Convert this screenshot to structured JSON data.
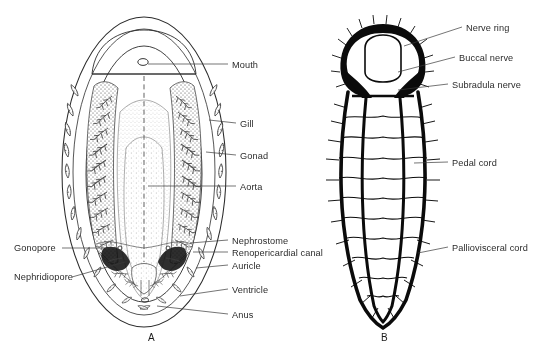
{
  "figure": {
    "domain": "scientific-illustration",
    "background_color": "#ffffff",
    "ink_color": "#0b0b0b",
    "label_color": "#2b2b2b",
    "panels": [
      {
        "letter": "A",
        "caption": "A",
        "description": "Ventral view showing mantle cavity, gills and internal organs",
        "letter_pos": {
          "x": 148,
          "y": 332
        }
      },
      {
        "letter": "B",
        "caption": "B",
        "description": "Nervous system: nerve ring with paired pedal and palliovisceral cords",
        "letter_pos": {
          "x": 381,
          "y": 332
        }
      }
    ],
    "labels_panel_a": [
      {
        "text": "Mouth",
        "side": "right",
        "x": 232,
        "y": 60,
        "leader_from": {
          "x": 228,
          "y": 64
        },
        "leader_to": {
          "x": 148,
          "y": 64
        }
      },
      {
        "text": "Gill",
        "side": "right",
        "x": 240,
        "y": 119,
        "leader_from": {
          "x": 236,
          "y": 123
        },
        "leader_to": {
          "x": 209,
          "y": 120
        }
      },
      {
        "text": "Gonad",
        "side": "right",
        "x": 240,
        "y": 151,
        "leader_from": {
          "x": 236,
          "y": 155
        },
        "leader_to": {
          "x": 206,
          "y": 152
        }
      },
      {
        "text": "Aorta",
        "side": "right",
        "x": 240,
        "y": 182,
        "leader_from": {
          "x": 236,
          "y": 186
        },
        "leader_to": {
          "x": 148,
          "y": 186
        }
      },
      {
        "text": "Nephrostome",
        "side": "right",
        "x": 232,
        "y": 236,
        "leader_from": {
          "x": 228,
          "y": 240
        },
        "leader_to": {
          "x": 190,
          "y": 243
        }
      },
      {
        "text": "Renopericardial canal",
        "side": "right",
        "x": 232,
        "y": 248,
        "leader_from": {
          "x": 228,
          "y": 252
        },
        "leader_to": {
          "x": 193,
          "y": 252
        }
      },
      {
        "text": "Auricle",
        "side": "right",
        "x": 232,
        "y": 261,
        "leader_from": {
          "x": 228,
          "y": 265
        },
        "leader_to": {
          "x": 196,
          "y": 268
        }
      },
      {
        "text": "Ventricle",
        "side": "right",
        "x": 232,
        "y": 285,
        "leader_from": {
          "x": 228,
          "y": 289
        },
        "leader_to": {
          "x": 180,
          "y": 296
        }
      },
      {
        "text": "Anus",
        "side": "right",
        "x": 232,
        "y": 310,
        "leader_from": {
          "x": 228,
          "y": 314
        },
        "leader_to": {
          "x": 157,
          "y": 306
        }
      },
      {
        "text": "Gonopore",
        "side": "left",
        "x": 14,
        "y": 243,
        "leader_from": {
          "x": 62,
          "y": 248
        },
        "leader_to": {
          "x": 118,
          "y": 248
        }
      },
      {
        "text": "Nephridiopore",
        "side": "left",
        "x": 14,
        "y": 272,
        "leader_from": {
          "x": 72,
          "y": 277
        },
        "leader_to": {
          "x": 125,
          "y": 262
        }
      }
    ],
    "labels_panel_b": [
      {
        "text": "Nerve ring",
        "side": "right",
        "x": 466,
        "y": 23,
        "leader_from": {
          "x": 462,
          "y": 27
        },
        "leader_to": {
          "x": 404,
          "y": 46
        }
      },
      {
        "text": "Buccal nerve",
        "side": "right",
        "x": 459,
        "y": 53,
        "leader_from": {
          "x": 455,
          "y": 57
        },
        "leader_to": {
          "x": 398,
          "y": 72
        }
      },
      {
        "text": "Subradula nerve",
        "side": "right",
        "x": 452,
        "y": 80,
        "leader_from": {
          "x": 448,
          "y": 84
        },
        "leader_to": {
          "x": 398,
          "y": 90
        }
      },
      {
        "text": "Pedal cord",
        "side": "right",
        "x": 452,
        "y": 158,
        "leader_from": {
          "x": 448,
          "y": 162
        },
        "leader_to": {
          "x": 414,
          "y": 163
        }
      },
      {
        "text": "Palliovisceral cord",
        "side": "right",
        "x": 452,
        "y": 243,
        "leader_from": {
          "x": 448,
          "y": 247
        },
        "leader_to": {
          "x": 418,
          "y": 253
        }
      }
    ]
  }
}
